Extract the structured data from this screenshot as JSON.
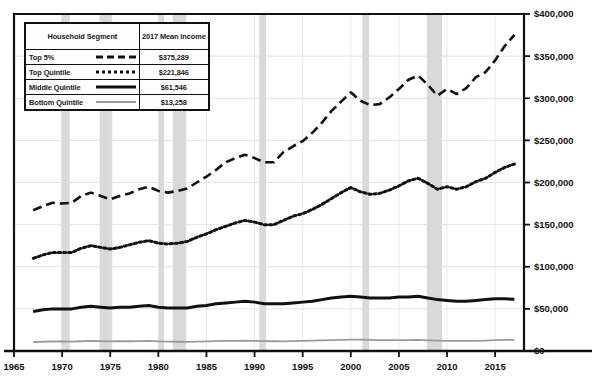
{
  "legend": {
    "header_segment": "Household Segment",
    "header_income": "2017 Mean Income",
    "rows": [
      {
        "segment": "Top 5%",
        "income": "$375,289",
        "style": "dashed"
      },
      {
        "segment": "Top Quintile",
        "income": "$221,846",
        "style": "dotted"
      },
      {
        "segment": "Middle Quintile",
        "income": "$61,546",
        "style": "solid"
      },
      {
        "segment": "Bottom Quintile",
        "income": "$13,258",
        "style": "thin"
      }
    ]
  },
  "chart_data": {
    "type": "line",
    "title": "",
    "subtitle": "",
    "xlabel": "",
    "ylabel": "",
    "xlim": [
      1965,
      2018
    ],
    "ylim": [
      0,
      400000
    ],
    "grid": true,
    "legend_position": "top-left",
    "y_ticks": [
      0,
      50000,
      100000,
      150000,
      200000,
      250000,
      300000,
      350000,
      400000
    ],
    "y_tick_labels": [
      "$0",
      "$50,000",
      "$100,000",
      "$150,000",
      "$200,000",
      "$250,000",
      "$300,000",
      "$350,000",
      "$400,000"
    ],
    "y_axis_side": "right",
    "x_ticks": [
      1965,
      1970,
      1975,
      1980,
      1985,
      1990,
      1995,
      2000,
      2005,
      2010,
      2015
    ],
    "x_tick_labels": [
      "1965",
      "1970",
      "1975",
      "1980",
      "1985",
      "1990",
      "1995",
      "2000",
      "2005",
      "2010",
      "2015"
    ],
    "x": [
      1967,
      1968,
      1969,
      1970,
      1971,
      1972,
      1973,
      1974,
      1975,
      1976,
      1977,
      1978,
      1979,
      1980,
      1981,
      1982,
      1983,
      1984,
      1985,
      1986,
      1987,
      1988,
      1989,
      1990,
      1991,
      1992,
      1993,
      1994,
      1995,
      1996,
      1997,
      1998,
      1999,
      2000,
      2001,
      2002,
      2003,
      2004,
      2005,
      2006,
      2007,
      2008,
      2009,
      2010,
      2011,
      2012,
      2013,
      2014,
      2015,
      2016,
      2017
    ],
    "series": [
      {
        "name": "Top 5%",
        "style": "dashed",
        "color": "#111111",
        "values": [
          167000,
          172000,
          176000,
          175000,
          176000,
          184000,
          188000,
          184000,
          180000,
          184000,
          187000,
          192000,
          195000,
          190000,
          188000,
          190000,
          193000,
          200000,
          207000,
          215000,
          224000,
          229000,
          233000,
          229000,
          224000,
          224000,
          236000,
          243000,
          249000,
          259000,
          271000,
          285000,
          296000,
          307000,
          297000,
          292000,
          293000,
          301000,
          311000,
          322000,
          327000,
          316000,
          303000,
          311000,
          305000,
          312000,
          325000,
          331000,
          345000,
          362000,
          375289
        ]
      },
      {
        "name": "Top Quintile",
        "style": "dotted",
        "color": "#111111",
        "values": [
          110000,
          114000,
          117000,
          117000,
          117000,
          122000,
          125000,
          123000,
          121000,
          123000,
          126000,
          129000,
          131000,
          128000,
          127000,
          128000,
          130000,
          135000,
          139000,
          144000,
          148000,
          152000,
          155000,
          153000,
          150000,
          150000,
          155000,
          160000,
          163000,
          168000,
          174000,
          181000,
          188000,
          194000,
          189000,
          186000,
          187000,
          191000,
          196000,
          202000,
          205000,
          199000,
          192000,
          195000,
          192000,
          195000,
          201000,
          205000,
          212000,
          218000,
          221846
        ]
      },
      {
        "name": "Middle Quintile",
        "style": "solid",
        "color": "#111111",
        "values": [
          47000,
          49000,
          50000,
          50000,
          50000,
          52000,
          53000,
          52000,
          51000,
          52000,
          52000,
          53000,
          54000,
          52000,
          51000,
          51000,
          51000,
          53000,
          54000,
          56000,
          57000,
          58000,
          59000,
          58000,
          56000,
          56000,
          56000,
          57000,
          58000,
          59000,
          61000,
          63000,
          64000,
          65000,
          64000,
          63000,
          63000,
          63000,
          64000,
          64000,
          65000,
          63000,
          61000,
          60000,
          59000,
          59000,
          60000,
          61000,
          62000,
          62000,
          61546
        ]
      },
      {
        "name": "Bottom Quintile",
        "style": "thin",
        "color": "#9a9a9a",
        "values": [
          10500,
          11000,
          11400,
          11300,
          11200,
          11600,
          11900,
          11700,
          11400,
          11600,
          11600,
          11800,
          11900,
          11500,
          11200,
          11000,
          10900,
          11200,
          11400,
          11700,
          11900,
          12100,
          12300,
          12100,
          11700,
          11600,
          11500,
          11700,
          12000,
          12200,
          12600,
          13000,
          13300,
          13600,
          13400,
          13100,
          13000,
          12900,
          13000,
          13000,
          13100,
          12700,
          12300,
          12100,
          11900,
          11900,
          12100,
          12400,
          12900,
          13100,
          13258
        ]
      }
    ],
    "recession_bands": [
      {
        "start": 1969.9,
        "end": 1970.8
      },
      {
        "start": 1973.9,
        "end": 1975.2
      },
      {
        "start": 1980.0,
        "end": 1980.6
      },
      {
        "start": 1981.5,
        "end": 1982.9
      },
      {
        "start": 1990.5,
        "end": 1991.2
      },
      {
        "start": 2001.2,
        "end": 2001.9
      },
      {
        "start": 2007.9,
        "end": 2009.5
      }
    ],
    "recession_color": "#d9d9d9"
  }
}
